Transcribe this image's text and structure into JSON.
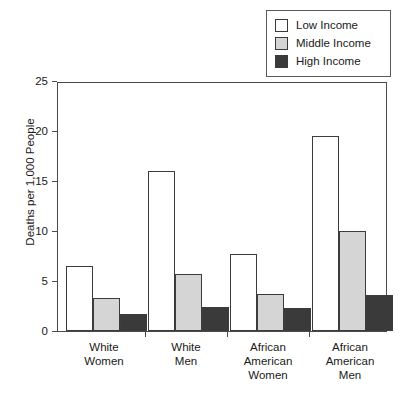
{
  "legend": {
    "position": "top-right",
    "items": [
      {
        "label": "Low Income",
        "color": "#ffffff"
      },
      {
        "label": "Middle Income",
        "color": "#d5d5d5"
      },
      {
        "label": "High Income",
        "color": "#3a3a3a"
      }
    ]
  },
  "axes": {
    "y_label": "Deaths per 1,000 People",
    "y_ticks": [
      "0",
      "5",
      "10",
      "15",
      "20",
      "25"
    ],
    "x_labels": [
      "White\nWomen",
      "White\nMen",
      "African\nAmerican\nWomen",
      "African\nAmerican\nMen"
    ]
  },
  "chart_data": {
    "type": "bar",
    "title": "",
    "subtitle": "",
    "xlabel": "",
    "ylabel": "Deaths per 1,000 People",
    "ylim": [
      0,
      25
    ],
    "ytick_interval": 5,
    "grid": false,
    "legend_position": "top-right",
    "categories": [
      "White Women",
      "White Men",
      "African American Women",
      "African American Men"
    ],
    "series": [
      {
        "name": "Low Income",
        "color": "#ffffff",
        "values": [
          6.5,
          16.0,
          7.7,
          19.5
        ]
      },
      {
        "name": "Middle Income",
        "color": "#d5d5d5",
        "values": [
          3.3,
          5.7,
          3.7,
          10.0
        ]
      },
      {
        "name": "High Income",
        "color": "#3a3a3a",
        "values": [
          1.7,
          2.4,
          2.3,
          3.6
        ]
      }
    ]
  }
}
